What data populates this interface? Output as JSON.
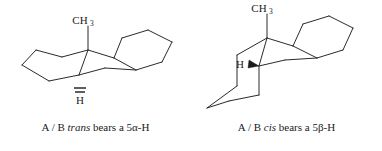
{
  "figure": {
    "background_color": "#ffffff",
    "bond_color": "#2a2a2a",
    "text_color": "#1a1a1a",
    "panels": [
      {
        "id": "trans",
        "title_parts": {
          "prefix": "A / B ",
          "emphasis": "trans",
          "suffix": " bears a 5α-H"
        },
        "caption_full": "A / B trans bears a 5α-H",
        "methyl_label": "CH",
        "methyl_subscript": "3",
        "hydrogen_label": "H",
        "stereo_bond_type": "hashed",
        "ring_fusion": "trans",
        "hydrogen_orientation": "5α",
        "hydrogen_position": "below-ring-axial",
        "methyl_position": "above-ring-axial"
      },
      {
        "id": "cis",
        "title_parts": {
          "prefix": "A / B ",
          "emphasis": "cis",
          "suffix": " bears a 5β-H"
        },
        "caption_full": "A / B cis bears a 5β-H",
        "methyl_label": "CH",
        "methyl_subscript": "3",
        "hydrogen_label": "H",
        "stereo_bond_type": "wedge",
        "ring_fusion": "cis",
        "hydrogen_orientation": "5β",
        "hydrogen_position": "left-of-junction-equatorial",
        "methyl_position": "above-ring-axial"
      }
    ]
  }
}
